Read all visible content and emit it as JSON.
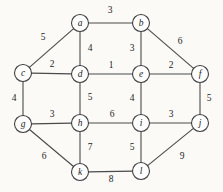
{
  "figure": {
    "background_color": "#fbfaf7",
    "stroke_color": "#4a4a4a",
    "node_fill_color": "#ffffff",
    "width": 223,
    "height": 192
  },
  "chart_data": {
    "type": "diagram",
    "subtype": "weighted-undirected-graph",
    "title": "",
    "xlabel": "",
    "ylabel": "",
    "node_radius": 8.5,
    "nodes": [
      {
        "id": "a",
        "label": "a",
        "x": 80,
        "y": 23
      },
      {
        "id": "b",
        "label": "b",
        "x": 141,
        "y": 23
      },
      {
        "id": "c",
        "label": "c",
        "x": 23,
        "y": 73
      },
      {
        "id": "d",
        "label": "d",
        "x": 80,
        "y": 74
      },
      {
        "id": "e",
        "label": "e",
        "x": 141,
        "y": 74
      },
      {
        "id": "f",
        "label": "f",
        "x": 200,
        "y": 74
      },
      {
        "id": "g",
        "label": "g",
        "x": 23,
        "y": 124
      },
      {
        "id": "h",
        "label": "h",
        "x": 80,
        "y": 123
      },
      {
        "id": "i",
        "label": "i",
        "x": 141,
        "y": 123
      },
      {
        "id": "j",
        "label": "j",
        "x": 200,
        "y": 123
      },
      {
        "id": "k",
        "label": "k",
        "x": 80,
        "y": 172
      },
      {
        "id": "l",
        "label": "l",
        "x": 141,
        "y": 171
      }
    ],
    "edges": [
      {
        "from": "a",
        "to": "b",
        "weight": 3,
        "label_x": 110,
        "label_y": 11
      },
      {
        "from": "a",
        "to": "c",
        "weight": 5,
        "label_x": 43,
        "label_y": 38
      },
      {
        "from": "a",
        "to": "d",
        "weight": 4,
        "label_x": 90,
        "label_y": 49
      },
      {
        "from": "b",
        "to": "e",
        "weight": 3,
        "label_x": 132,
        "label_y": 49
      },
      {
        "from": "b",
        "to": "f",
        "weight": 6,
        "label_x": 180,
        "label_y": 42
      },
      {
        "from": "c",
        "to": "d",
        "weight": 2,
        "label_x": 52,
        "label_y": 65
      },
      {
        "from": "c",
        "to": "g",
        "weight": 4,
        "label_x": 14,
        "label_y": 99
      },
      {
        "from": "d",
        "to": "e",
        "weight": 1,
        "label_x": 111,
        "label_y": 66
      },
      {
        "from": "d",
        "to": "h",
        "weight": 5,
        "label_x": 90,
        "label_y": 98
      },
      {
        "from": "e",
        "to": "f",
        "weight": 2,
        "label_x": 171,
        "label_y": 66
      },
      {
        "from": "e",
        "to": "i",
        "weight": 4,
        "label_x": 132,
        "label_y": 99
      },
      {
        "from": "f",
        "to": "j",
        "weight": 5,
        "label_x": 209,
        "label_y": 99
      },
      {
        "from": "g",
        "to": "h",
        "weight": 3,
        "label_x": 52,
        "label_y": 115
      },
      {
        "from": "g",
        "to": "k",
        "weight": 6,
        "label_x": 44,
        "label_y": 157
      },
      {
        "from": "h",
        "to": "i",
        "weight": 6,
        "label_x": 112,
        "label_y": 115
      },
      {
        "from": "h",
        "to": "k",
        "weight": 7,
        "label_x": 90,
        "label_y": 148
      },
      {
        "from": "i",
        "to": "j",
        "weight": 3,
        "label_x": 171,
        "label_y": 115
      },
      {
        "from": "i",
        "to": "l",
        "weight": 5,
        "label_x": 132,
        "label_y": 148
      },
      {
        "from": "j",
        "to": "l",
        "weight": 9,
        "label_x": 182,
        "label_y": 157
      },
      {
        "from": "k",
        "to": "l",
        "weight": 8,
        "label_x": 111,
        "label_y": 180
      }
    ]
  }
}
